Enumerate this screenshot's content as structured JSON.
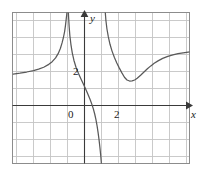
{
  "chart_data": {
    "type": "line",
    "title": "",
    "xlabel": "x",
    "ylabel": "y",
    "xlim": [
      -4.2,
      6.3
    ],
    "ylim": [
      -3.5,
      5.5
    ],
    "grid": true,
    "legend": null,
    "x_ticks": [
      {
        "value": 0,
        "label": "0"
      },
      {
        "value": 2,
        "label": "2"
      }
    ],
    "y_ticks": [
      {
        "value": 2,
        "label": "2"
      }
    ],
    "asymptotes": {
      "vertical": [
        -1.0,
        1.2
      ],
      "horizontal": [
        1.0
      ]
    },
    "annotations": [
      {
        "name": "local-minimum",
        "x": 2.4,
        "y": 1.45
      }
    ],
    "series": [
      {
        "name": "branch-left",
        "comment": "Rises from left edge toward vertical asymptote at x = -1",
        "points": [
          [
            -4.2,
            1.85
          ],
          [
            -3.8,
            1.9
          ],
          [
            -3.4,
            1.97
          ],
          [
            -3.0,
            2.05
          ],
          [
            -2.7,
            2.14
          ],
          [
            -2.4,
            2.25
          ],
          [
            -2.1,
            2.42
          ],
          [
            -1.9,
            2.58
          ],
          [
            -1.7,
            2.8
          ],
          [
            -1.55,
            3.05
          ],
          [
            -1.42,
            3.35
          ],
          [
            -1.32,
            3.68
          ],
          [
            -1.24,
            4.0
          ],
          [
            -1.17,
            4.35
          ],
          [
            -1.12,
            4.7
          ],
          [
            -1.08,
            5.05
          ],
          [
            -1.05,
            5.3
          ],
          [
            -1.03,
            5.5
          ]
        ]
      },
      {
        "name": "branch-middle",
        "comment": "Descends from top near x = -1 through the y-axis to the bottom edge",
        "points": [
          [
            -0.95,
            5.5
          ],
          [
            -0.93,
            5.1
          ],
          [
            -0.9,
            4.6
          ],
          [
            -0.86,
            4.1
          ],
          [
            -0.8,
            3.6
          ],
          [
            -0.72,
            3.1
          ],
          [
            -0.62,
            2.65
          ],
          [
            -0.5,
            2.25
          ],
          [
            -0.36,
            1.9
          ],
          [
            -0.2,
            1.55
          ],
          [
            -0.04,
            1.2
          ],
          [
            0.1,
            0.9
          ],
          [
            0.22,
            0.62
          ],
          [
            0.33,
            0.35
          ],
          [
            0.43,
            0.08
          ],
          [
            0.52,
            -0.2
          ],
          [
            0.6,
            -0.5
          ],
          [
            0.67,
            -0.82
          ],
          [
            0.74,
            -1.2
          ],
          [
            0.8,
            -1.6
          ],
          [
            0.86,
            -2.05
          ],
          [
            0.91,
            -2.5
          ],
          [
            0.96,
            -3.0
          ],
          [
            1.0,
            -3.5
          ]
        ]
      },
      {
        "name": "branch-right",
        "comment": "Falls from top at x = 1.2, local minimum near x = 2.4, then rises to horizontal asymptote",
        "points": [
          [
            1.22,
            5.5
          ],
          [
            1.26,
            5.0
          ],
          [
            1.32,
            4.5
          ],
          [
            1.4,
            4.05
          ],
          [
            1.5,
            3.6
          ],
          [
            1.62,
            3.2
          ],
          [
            1.76,
            2.82
          ],
          [
            1.9,
            2.5
          ],
          [
            2.05,
            2.2
          ],
          [
            2.2,
            1.92
          ],
          [
            2.35,
            1.66
          ],
          [
            2.5,
            1.5
          ],
          [
            2.65,
            1.44
          ],
          [
            2.8,
            1.45
          ],
          [
            2.95,
            1.5
          ],
          [
            3.1,
            1.6
          ],
          [
            3.3,
            1.78
          ],
          [
            3.5,
            1.97
          ],
          [
            3.7,
            2.16
          ],
          [
            3.9,
            2.33
          ],
          [
            4.1,
            2.48
          ],
          [
            4.35,
            2.64
          ],
          [
            4.6,
            2.77
          ],
          [
            4.9,
            2.89
          ],
          [
            5.2,
            2.98
          ],
          [
            5.5,
            3.05
          ],
          [
            5.8,
            3.1
          ],
          [
            6.1,
            3.14
          ],
          [
            6.3,
            3.16
          ]
        ]
      }
    ],
    "colors": {
      "curve": "#595959",
      "grid": "#c4c4c4",
      "frame": "#8c8c8c",
      "axis": "#3a3a3a",
      "background": "#ffffff"
    }
  }
}
